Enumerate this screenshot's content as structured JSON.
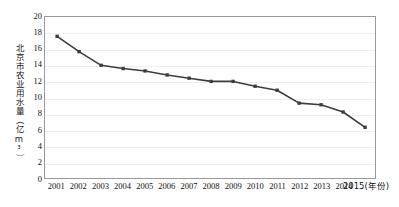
{
  "chart_data": {
    "type": "line",
    "title": "",
    "subtitle": "",
    "xlabel": "(年份)",
    "ylabel": "北京市农业用水量（亿m³）",
    "categories": [
      "2001",
      "2002",
      "2003",
      "2004",
      "2005",
      "2006",
      "2007",
      "2008",
      "2009",
      "2010",
      "2011",
      "2012",
      "2013",
      "2014",
      "2015"
    ],
    "x_tick_labels": [
      "2001",
      "2002",
      "2003",
      "2004",
      "2005",
      "2006",
      "2007",
      "2008",
      "2009",
      "2010",
      "2011",
      "2012",
      "2013",
      "2014",
      "2015(年份)"
    ],
    "values": [
      17.6,
      15.7,
      14.0,
      13.6,
      13.3,
      12.8,
      12.4,
      12.0,
      12.0,
      11.4,
      10.9,
      9.3,
      9.1,
      8.2,
      6.3
    ],
    "y_tick_labels": [
      "20",
      "18",
      "16",
      "14",
      "12",
      "10",
      "8",
      "6",
      "4",
      "2",
      "0"
    ],
    "y_ticks": [
      20,
      18,
      16,
      14,
      12,
      10,
      8,
      6,
      4,
      2,
      0
    ],
    "ylim": [
      0,
      20
    ],
    "y_step": 2,
    "grid": true,
    "grid_axis": "y",
    "legend": false,
    "legend_position": "none",
    "series_name": "北京市农业用水量",
    "marker": "square",
    "line_color": "#3d3d3d",
    "marker_color": "#3d3d3d",
    "grid_color": "#efeff1",
    "border_color": "#9a9a9a",
    "background_color": "#ffffff"
  }
}
